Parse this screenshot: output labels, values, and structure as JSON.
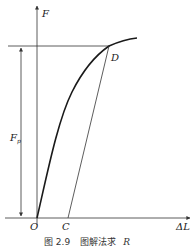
{
  "figure": {
    "caption_prefix": "图 2.9",
    "caption_text": "图解法求",
    "caption_var": "R"
  },
  "labels": {
    "y_axis": "F",
    "x_axis": "ΔL",
    "origin": "O",
    "point_c": "C",
    "point_d": "D",
    "fp_main": "F",
    "fp_sub": "p"
  },
  "colors": {
    "line": "#333333",
    "curve": "#1a1a1a",
    "background": "#ffffff"
  }
}
